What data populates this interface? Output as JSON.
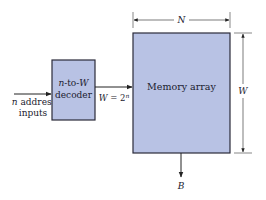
{
  "diagram": {
    "colors": {
      "box_fill": "#b8c2e4",
      "box_stroke": "#2a2a3a",
      "line": "#222222",
      "text": "#1a1a2e"
    },
    "input": {
      "label_var": "n",
      "label_line1": " address",
      "label_line2": "inputs"
    },
    "decoder": {
      "line1_a": "n",
      "line1_b": "-to-",
      "line1_c": "W",
      "line2": "decoder"
    },
    "decoder_output": {
      "lhs": "W",
      "eq": " = 2",
      "exp": "n"
    },
    "memory_array": {
      "label": "Memory array"
    },
    "dimensions": {
      "width_label": "N",
      "height_label": "W"
    },
    "output": {
      "label": "B"
    }
  }
}
